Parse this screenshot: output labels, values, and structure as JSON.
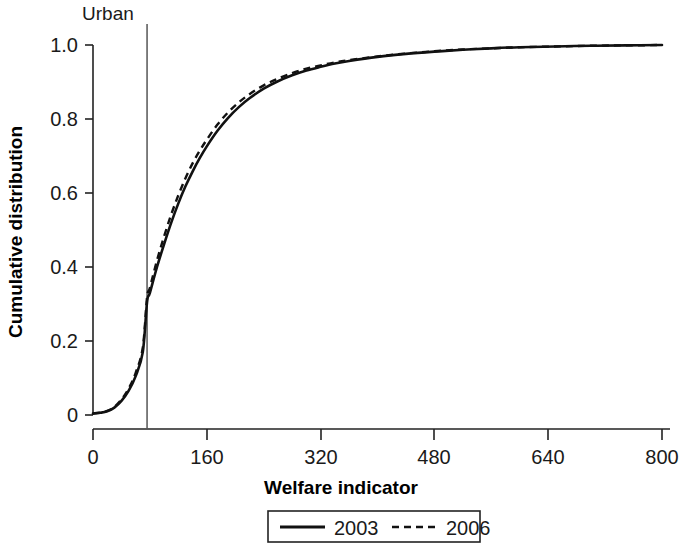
{
  "chart_data": {
    "type": "line",
    "title": "",
    "xlabel": "Welfare indicator",
    "ylabel": "Cumulative distribution",
    "xlim": [
      0,
      800
    ],
    "ylim": [
      0,
      1.0
    ],
    "grid": false,
    "legend_position": "bottom",
    "x_ticks": [
      {
        "value": 0,
        "label": "0"
      },
      {
        "value": 160,
        "label": "160"
      },
      {
        "value": 320,
        "label": "320"
      },
      {
        "value": 480,
        "label": "480"
      },
      {
        "value": 640,
        "label": "640"
      },
      {
        "value": 800,
        "label": "800"
      }
    ],
    "y_ticks": [
      {
        "value": 0,
        "label": "0"
      },
      {
        "value": 0.2,
        "label": "0.2"
      },
      {
        "value": 0.4,
        "label": "0.4"
      },
      {
        "value": 0.6,
        "label": "0.6"
      },
      {
        "value": 0.8,
        "label": "0.8"
      },
      {
        "value": 1.0,
        "label": "1.0"
      }
    ],
    "annotations": [
      {
        "name": "urban-poverty-line",
        "label": "Urban",
        "type": "vertical-line",
        "x": 76
      }
    ],
    "x": [
      0,
      10,
      20,
      30,
      40,
      50,
      60,
      70,
      76,
      80,
      90,
      100,
      110,
      120,
      130,
      140,
      150,
      160,
      175,
      190,
      205,
      220,
      240,
      260,
      280,
      300,
      320,
      340,
      360,
      400,
      440,
      480,
      520,
      560,
      600,
      650,
      700,
      750,
      800
    ],
    "series": [
      {
        "name": "2003",
        "style": "solid",
        "color": "#111111",
        "values": [
          0.004,
          0.006,
          0.01,
          0.02,
          0.038,
          0.065,
          0.105,
          0.17,
          0.305,
          0.33,
          0.4,
          0.462,
          0.52,
          0.572,
          0.618,
          0.658,
          0.694,
          0.726,
          0.768,
          0.803,
          0.832,
          0.856,
          0.882,
          0.902,
          0.918,
          0.931,
          0.941,
          0.95,
          0.957,
          0.968,
          0.976,
          0.982,
          0.987,
          0.991,
          0.994,
          0.996,
          0.998,
          0.999,
          1.0
        ]
      },
      {
        "name": "2006",
        "style": "dashed",
        "color": "#111111",
        "values": [
          0.004,
          0.006,
          0.011,
          0.022,
          0.042,
          0.071,
          0.114,
          0.182,
          0.318,
          0.344,
          0.418,
          0.483,
          0.542,
          0.594,
          0.64,
          0.68,
          0.714,
          0.744,
          0.785,
          0.818,
          0.845,
          0.867,
          0.891,
          0.909,
          0.924,
          0.936,
          0.945,
          0.953,
          0.959,
          0.969,
          0.977,
          0.983,
          0.988,
          0.991,
          0.994,
          0.996,
          0.998,
          0.999,
          1.0
        ]
      }
    ],
    "legend": [
      {
        "label": "2003",
        "style": "solid"
      },
      {
        "label": "2006",
        "style": "dashed"
      }
    ]
  },
  "colors": {
    "axis": "#222222",
    "series": "#111111",
    "vline": "#555555",
    "background": "#ffffff"
  }
}
